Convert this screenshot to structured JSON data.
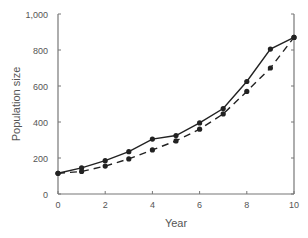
{
  "chart_data": {
    "type": "line",
    "title": "",
    "xlabel": "Year",
    "ylabel": "Population size",
    "xlim": [
      0,
      10
    ],
    "ylim": [
      0,
      1000
    ],
    "xticks": [
      0,
      2,
      4,
      6,
      8,
      10
    ],
    "xtick_labels": [
      "0",
      "2",
      "4",
      "6",
      "8",
      "10"
    ],
    "yticks": [
      0,
      200,
      400,
      600,
      800,
      1000
    ],
    "ytick_labels": [
      "0",
      "200",
      "400",
      "600",
      "800",
      "1,000"
    ],
    "grid": false,
    "legend": null,
    "x": [
      0,
      1,
      2,
      3,
      4,
      5,
      6,
      7,
      8,
      9,
      10
    ],
    "series": [
      {
        "name": "solid",
        "style": "solid",
        "marker": "circle",
        "color": "#222222",
        "values": [
          115,
          145,
          185,
          235,
          305,
          325,
          395,
          475,
          625,
          805,
          870
        ]
      },
      {
        "name": "dashed",
        "style": "dashed",
        "marker": "circle",
        "color": "#222222",
        "values": [
          115,
          125,
          155,
          195,
          245,
          295,
          360,
          445,
          570,
          700,
          870
        ]
      }
    ]
  }
}
